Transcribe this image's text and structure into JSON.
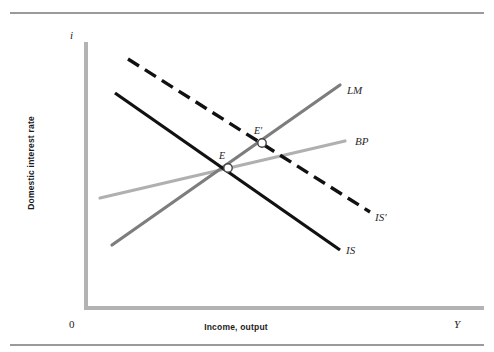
{
  "figure": {
    "width": 494,
    "height": 352,
    "background": "#ffffff"
  },
  "rules": {
    "top_label": "top-rule",
    "bottom_label": "bottom-rule",
    "color": "#9a9a9a"
  },
  "axes": {
    "origin_label": "0",
    "y_axis_symbol": "i",
    "y_axis_title": "Domestic interest rate",
    "x_axis_symbol": "Y",
    "x_axis_title": "Income, output",
    "axis_color": "#b3b3b3",
    "axis_width": 4,
    "x_axis": {
      "y": 308,
      "x_start": 86,
      "x_end": 484
    },
    "y_axis": {
      "x": 86,
      "y_start": 42,
      "y_end": 308
    }
  },
  "chart_data": {
    "type": "line",
    "title": "",
    "xlabel": "Income, output",
    "ylabel": "Domestic interest rate",
    "xlim": [
      86,
      484
    ],
    "ylim": [
      308,
      42
    ],
    "grid": false,
    "legend": "inline-right",
    "series": [
      {
        "name": "IS",
        "label": "IS",
        "style": "solid",
        "color": "#111111",
        "width": 3.2,
        "x": [
          115,
          340
        ],
        "y": [
          93,
          250
        ],
        "label_x": 346,
        "label_y": 251
      },
      {
        "name": "IS'",
        "label": "IS′",
        "style": "dashed",
        "dash": "13,7",
        "color": "#111111",
        "width": 3.4,
        "x": [
          128,
          370
        ],
        "y": [
          59,
          212
        ],
        "label_x": 375,
        "label_y": 218
      },
      {
        "name": "LM",
        "label": "LM",
        "style": "solid",
        "color": "#7d7d7d",
        "width": 3.2,
        "x": [
          112,
          340
        ],
        "y": [
          245,
          85
        ],
        "label_x": 347,
        "label_y": 91
      },
      {
        "name": "BP",
        "label": "BP",
        "style": "solid",
        "color": "#b0b0b0",
        "width": 3.2,
        "x": [
          100,
          345
        ],
        "y": [
          198,
          141
        ],
        "label_x": 355,
        "label_y": 142
      }
    ],
    "points": [
      {
        "name": "E",
        "label": "E",
        "x": 228,
        "y": 168,
        "label_x": 219,
        "label_y": 150,
        "marker": "open-circle",
        "radius": 4.2,
        "fill": "#ffffff",
        "stroke": "#444444"
      },
      {
        "name": "E-prime",
        "label": "E′",
        "x": 262,
        "y": 143,
        "label_x": 254,
        "label_y": 125,
        "marker": "open-circle",
        "radius": 4.2,
        "fill": "#ffffff",
        "stroke": "#444444"
      }
    ],
    "annotations": [
      {
        "name": "origin",
        "text": "0",
        "x": 70,
        "y": 319
      },
      {
        "name": "y-axis-symbol",
        "text": "i",
        "x": 72,
        "y": 30
      },
      {
        "name": "x-axis-symbol",
        "text": "Y",
        "x": 455,
        "y": 319
      }
    ]
  }
}
